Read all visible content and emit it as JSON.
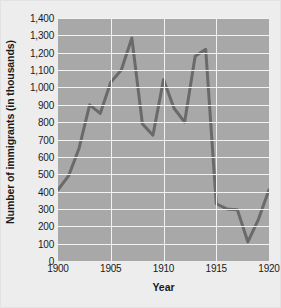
{
  "chart_data": {
    "type": "line",
    "title": "",
    "xlabel": "Year",
    "ylabel": "Number of immigrants (in thousands)",
    "xlim": [
      1900,
      1920
    ],
    "ylim": [
      0,
      1400
    ],
    "grid": true,
    "legend": null,
    "x_tick_labels": [
      "1900",
      "1905",
      "1910",
      "1915",
      "1920"
    ],
    "x_tick_values": [
      1900,
      1905,
      1910,
      1915,
      1920
    ],
    "y_tick_labels": [
      "0",
      "100",
      "200",
      "300",
      "400",
      "500",
      "600",
      "700",
      "800",
      "900",
      "1,000",
      "1,100",
      "1,200",
      "1,300",
      "1,400"
    ],
    "y_tick_values": [
      0,
      100,
      200,
      300,
      400,
      500,
      600,
      700,
      800,
      900,
      1000,
      1100,
      1200,
      1300,
      1400
    ],
    "x": [
      1900,
      1901,
      1902,
      1903,
      1904,
      1905,
      1906,
      1907,
      1908,
      1909,
      1910,
      1911,
      1912,
      1913,
      1914,
      1915,
      1916,
      1917,
      1918,
      1919,
      1920
    ],
    "values": [
      410,
      490,
      650,
      900,
      850,
      1030,
      1100,
      1285,
      790,
      725,
      1045,
      880,
      800,
      1180,
      1220,
      330,
      300,
      295,
      110,
      240,
      410
    ],
    "series": [
      {
        "name": "Number of immigrants (in thousands)",
        "values": [
          410,
          490,
          650,
          900,
          850,
          1030,
          1100,
          1285,
          790,
          725,
          1045,
          880,
          800,
          1180,
          1220,
          330,
          300,
          295,
          110,
          240,
          410
        ]
      }
    ],
    "colors": {
      "line": "#6a6a6a",
      "plot_background": "#a8a8a8",
      "grid": "#f2f2f2",
      "figure_background": "#ededed",
      "text": "#1a1a1a"
    }
  }
}
